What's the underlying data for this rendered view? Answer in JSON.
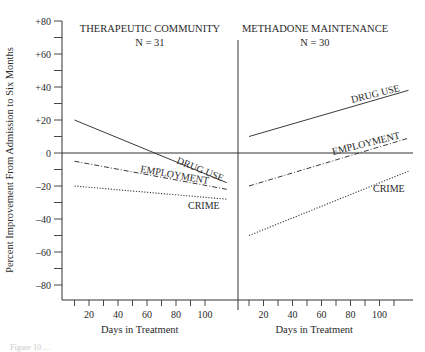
{
  "chart_data": {
    "type": "line",
    "ylabel": "Percent Improvement From Admission to Six Months",
    "ylim": [
      -90,
      80
    ],
    "y_ticks": [
      80,
      60,
      40,
      20,
      0,
      -20,
      -40,
      -60,
      -80
    ],
    "y_tick_labels": [
      "+80",
      "+60",
      "+40",
      "+20",
      "0",
      "–20",
      "–40",
      "–60",
      "–80"
    ],
    "grid": false,
    "legend_position": "inline labels on lines",
    "panels": [
      {
        "title": "THERAPEUTIC COMMUNITY",
        "subtitle": "N = 31",
        "xlabel": "Days in Treatment",
        "x_tick_labels": [
          "20",
          "40",
          "60",
          "80",
          "100"
        ],
        "x_range": [
          10,
          115
        ],
        "series": [
          {
            "name": "DRUG USE",
            "style": "solid",
            "x": [
              10,
              115
            ],
            "values": [
              20,
              -18
            ]
          },
          {
            "name": "EMPLOYMENT",
            "style": "dash-dot",
            "x": [
              10,
              115
            ],
            "values": [
              -5,
              -22
            ]
          },
          {
            "name": "CRIME",
            "style": "dotted",
            "x": [
              10,
              115
            ],
            "values": [
              -20,
              -28
            ]
          }
        ]
      },
      {
        "title": "METHADONE MAINTENANCE",
        "subtitle": "N = 30",
        "xlabel": "Days in Treatment",
        "x_tick_labels": [
          "20",
          "40",
          "60",
          "80",
          "100"
        ],
        "x_range": [
          10,
          120
        ],
        "series": [
          {
            "name": "DRUG USE",
            "style": "solid",
            "x": [
              10,
              120
            ],
            "values": [
              10,
              38
            ]
          },
          {
            "name": "EMPLOYMENT",
            "style": "dash-dot",
            "x": [
              10,
              120
            ],
            "values": [
              -20,
              9
            ]
          },
          {
            "name": "CRIME",
            "style": "dotted",
            "x": [
              10,
              120
            ],
            "values": [
              -50,
              -11
            ]
          }
        ]
      }
    ]
  },
  "caption": "Figure 10.…"
}
